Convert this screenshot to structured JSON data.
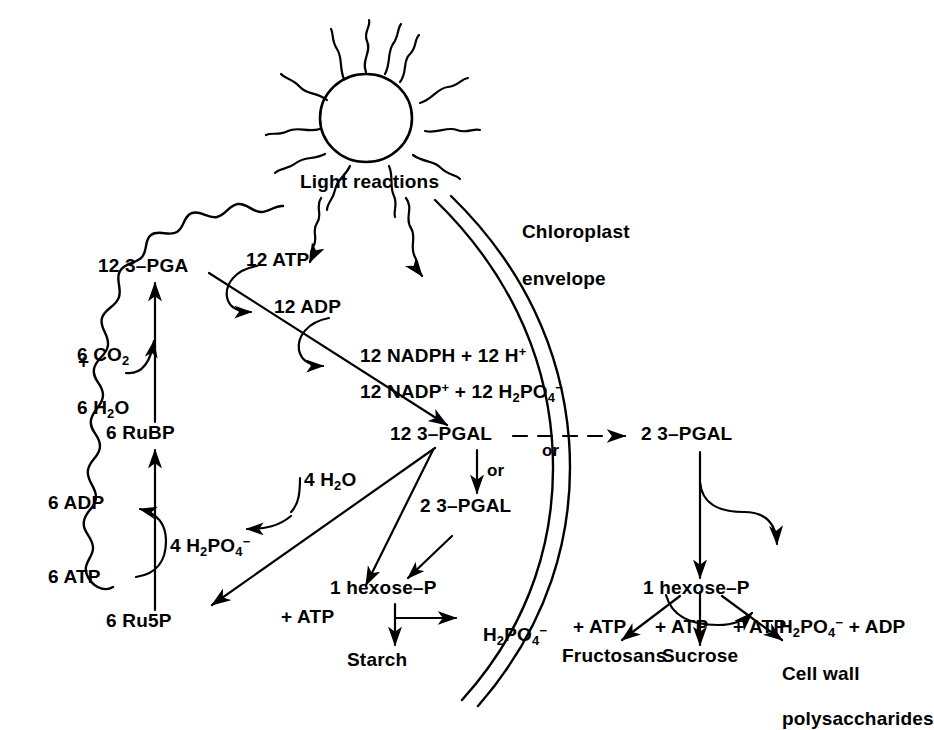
{
  "diagram": {
    "stroke_color": "#000000",
    "background_color": "#ffffff"
  },
  "sun": {
    "label": "Light reactions",
    "ray_count": 12
  },
  "envelope": {
    "label_line1": "Chloroplast",
    "label_line2": "envelope"
  },
  "calvin": {
    "pga": "12 3–PGA",
    "co2": "6 CO",
    "co2_sub": "2",
    "plus": "+",
    "h2o": "6 H",
    "h2o_sub": "2",
    "h2o_tail": "O",
    "rubp": "6 RuBP",
    "adp": "6 ADP",
    "atp": "6 ATP",
    "ru5p": "6 Ru5P"
  },
  "light_products": {
    "atp12": "12 ATP",
    "adp12": "12 ADP",
    "nadph": "12 NADPH + 12 H",
    "nadph_sup": "+",
    "nadp": "12 NADP",
    "nadp_sup": "+",
    "nadp_rest": " + 12 H",
    "nadp_sub": "2",
    "nadp_po": "PO",
    "nadp_sub4": "4",
    "nadp_minus": "−"
  },
  "pgal": {
    "inside": "12 3–PGAL",
    "or_horizontal": "or",
    "or_vertical": "or",
    "inside_2pgal": "2 3–PGAL",
    "outside_2pgal": "2 3–PGAL"
  },
  "water_split": {
    "h2o": "4 H",
    "h2o_sub": "2",
    "h2o_tail": "O",
    "phosphate": "4 H",
    "phosphate_sub": "2",
    "phosphate_po": "PO",
    "phosphate_sub4": "4",
    "phosphate_minus": "−"
  },
  "starch_branch": {
    "hexose": "1 hexose–P",
    "atp": "+ ATP",
    "phosphate": "H",
    "phosphate_sub": "2",
    "phosphate_po": "PO",
    "phosphate_sub4": "4",
    "phosphate_minus": "−",
    "product": "Starch"
  },
  "cytosol_branch": {
    "hexose": "1 hexose–P",
    "phosphate": "H",
    "phosphate_sub": "2",
    "phosphate_po": "PO",
    "phosphate_sub4": "4",
    "phosphate_minus": "−",
    "phosphate_tail": " + ADP",
    "atp1": "+ ATP",
    "atp2": "+ ATP",
    "atp3": "+ ATP",
    "product1": "Fructosans",
    "product2": "Sucrose",
    "product3_line1": "Cell wall",
    "product3_line2": "polysaccharides"
  }
}
